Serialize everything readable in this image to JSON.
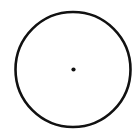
{
  "diagram": {
    "background": "#ffffff",
    "circle": {
      "cx": 73,
      "cy": 69.5,
      "r": 57.5,
      "stroke": "#111111",
      "stroke_width": 2.6,
      "fill": "none"
    },
    "center_dot": {
      "cx": 73.5,
      "cy": 69.5,
      "r": 2.1,
      "fill": "#111111"
    }
  }
}
